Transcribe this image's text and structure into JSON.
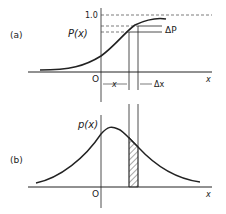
{
  "panel_a": {
    "tag": "(a)",
    "curve_label": "P(x)",
    "y_tick": "1.0",
    "delta_p": "ΔP",
    "origin": "O",
    "axis_label": "x",
    "x_interval_label": "x",
    "delta_x": "Δx"
  },
  "panel_b": {
    "tag": "(b)",
    "curve_label": "p(x)",
    "origin": "O",
    "axis_label": "x"
  },
  "colors": {
    "ink": "#222222",
    "background": "#ffffff"
  }
}
